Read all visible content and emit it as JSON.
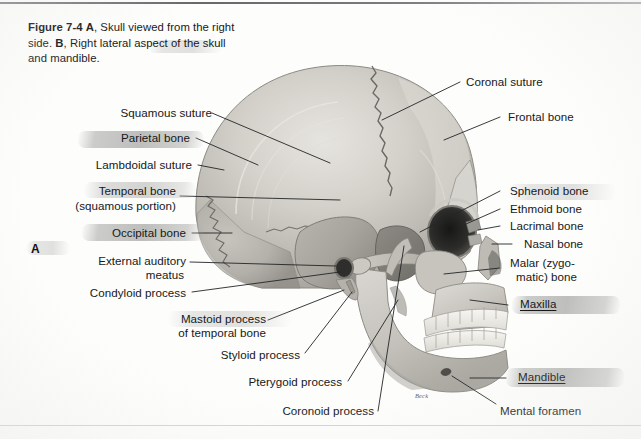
{
  "figure": {
    "number": "Figure 7-4",
    "caption_part_a_marker": "A",
    "caption_part_a_text": ", Skull viewed from the right side. ",
    "caption_part_b_marker": "B",
    "caption_part_b_text": ", Right lateral aspect of the skull and mandible.",
    "panel_letter": "A",
    "artist_signature": "Beck"
  },
  "labels_left": [
    {
      "id": "squamous-suture",
      "text": "Squamous suture",
      "highlight": "none"
    },
    {
      "id": "parietal-bone",
      "text": "Parietal bone",
      "highlight": "strong"
    },
    {
      "id": "lambdoidal-suture",
      "text": "Lambdoidal suture",
      "highlight": "none"
    },
    {
      "id": "temporal-bone",
      "text": "Temporal bone",
      "highlight": "medium"
    },
    {
      "id": "temporal-bone-sub",
      "text": "(squamous portion)",
      "highlight": "none"
    },
    {
      "id": "occipital-bone",
      "text": "Occipital bone",
      "highlight": "strong"
    },
    {
      "id": "external-auditory",
      "text": "External auditory",
      "highlight": "none"
    },
    {
      "id": "external-meatus",
      "text": "meatus",
      "highlight": "none"
    },
    {
      "id": "condyloid-process",
      "text": "Condyloid process",
      "highlight": "none"
    },
    {
      "id": "mastoid-process",
      "text": "Mastoid process",
      "highlight": "none"
    },
    {
      "id": "mastoid-temporal",
      "text": "of temporal bone",
      "highlight": "none"
    },
    {
      "id": "styloid-process",
      "text": "Styloid process",
      "highlight": "none"
    },
    {
      "id": "pterygoid-process",
      "text": "Pterygoid process",
      "highlight": "none"
    },
    {
      "id": "coronoid-process",
      "text": "Coronoid process",
      "highlight": "none"
    }
  ],
  "labels_right": [
    {
      "id": "coronal-suture",
      "text": "Coronal suture",
      "highlight": "none"
    },
    {
      "id": "frontal-bone",
      "text": "Frontal bone",
      "highlight": "none"
    },
    {
      "id": "sphenoid-bone",
      "text": "Sphenoid bone",
      "highlight": "light"
    },
    {
      "id": "ethmoid-bone",
      "text": "Ethmoid bone",
      "highlight": "none"
    },
    {
      "id": "lacrimal-bone",
      "text": "Lacrimal bone",
      "highlight": "none"
    },
    {
      "id": "nasal-bone",
      "text": "Nasal bone",
      "highlight": "none"
    },
    {
      "id": "malar-bone-1",
      "text": "Malar (zygo-",
      "highlight": "none"
    },
    {
      "id": "malar-bone-2",
      "text": "matic) bone",
      "highlight": "none"
    },
    {
      "id": "maxilla",
      "text": "Maxilla",
      "highlight": "strong",
      "underline": true
    },
    {
      "id": "mandible",
      "text": "Mandible",
      "highlight": "strong",
      "underline": true
    },
    {
      "id": "mental-foramen",
      "text": "Mental foramen",
      "highlight": "none"
    }
  ],
  "colors": {
    "page_background": "#fdfdfc",
    "text": "#16181a",
    "leader_line": "#232527",
    "highlighter": "#a3a5a2",
    "bone_light": "#d8d6d0",
    "bone_mid": "#b9b7b1",
    "bone_dark": "#97958f",
    "orbit_dark": "#2a2a28",
    "tooth": "#f2f1ec"
  }
}
